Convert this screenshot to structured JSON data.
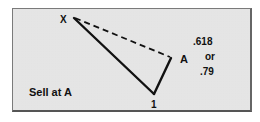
{
  "diagram": {
    "points": {
      "X": {
        "label": "X",
        "x": 74,
        "y": 18
      },
      "A": {
        "label": "A",
        "x": 171,
        "y": 58
      },
      "one": {
        "label": "1",
        "x": 154,
        "y": 95
      }
    },
    "ratio_text": {
      "line1": ".618",
      "line2": "or",
      "line3": ".79"
    },
    "caption": "Sell at A",
    "colors": {
      "background": "#c4c4c4",
      "lines": "#111111"
    }
  }
}
